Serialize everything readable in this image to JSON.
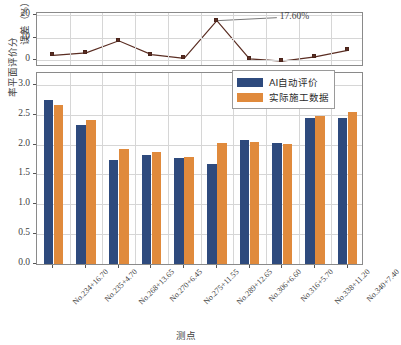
{
  "chart_data": [
    {
      "type": "line",
      "title": "",
      "ylabel": "误差（%）",
      "xlabel": "",
      "ylim": [
        -2,
        21
      ],
      "yticks": [
        0,
        10,
        20
      ],
      "grid": true,
      "categories": [
        "No.234+16.70",
        "No.235+4.70",
        "No.268+13.65",
        "No.270+6.45",
        "No.275+11.55",
        "No.289+12.65",
        "No.306+6.60",
        "No.316+5.70",
        "No.338+11.20",
        "No.340+7.40"
      ],
      "series": [
        {
          "name": "误差",
          "color": "#5a2d22",
          "values": [
            2.3,
            3.4,
            8.7,
            2.6,
            0.9,
            17.6,
            0.7,
            -0.3,
            1.6,
            4.5
          ]
        }
      ],
      "annotations": [
        {
          "text": "17.60%",
          "point_index": 5,
          "value": 17.6
        }
      ]
    },
    {
      "type": "bar",
      "title": "",
      "ylabel": "率平面评价分",
      "xlabel": "测点",
      "ylim": [
        0,
        3.2
      ],
      "yticks": [
        "0.0",
        "0.5",
        "1.0",
        "1.5",
        "2.0",
        "2.5",
        "3.0"
      ],
      "ytick_values": [
        0.0,
        0.5,
        1.0,
        1.5,
        2.0,
        2.5,
        3.0
      ],
      "grid": true,
      "legend_position": "upper right",
      "categories": [
        "No.234+16.70",
        "No.235+4.70",
        "No.268+13.65",
        "No.270+6.45",
        "No.275+11.55",
        "No.289+12.65",
        "No.306+6.60",
        "No.316+5.70",
        "No.338+11.20",
        "No.340+7.40"
      ],
      "series": [
        {
          "name": "AI自动评价",
          "color": "#2e4a7d",
          "values": [
            2.74,
            2.33,
            1.75,
            1.83,
            1.78,
            1.68,
            2.07,
            2.03,
            2.44,
            2.44
          ]
        },
        {
          "name": "实际施工数据",
          "color": "#e08a3c",
          "values": [
            2.67,
            2.42,
            1.92,
            1.88,
            1.8,
            2.03,
            2.04,
            2.01,
            2.48,
            2.55
          ]
        }
      ]
    }
  ],
  "top_chart": {
    "ylabel": "误差（%）",
    "yticks": [
      "0",
      "10",
      "20"
    ],
    "annotation": "17.60%"
  },
  "bottom_chart": {
    "ylabel": "率平面评价分",
    "xlabel": "测点",
    "yticks": [
      "0.0",
      "0.5",
      "1.0",
      "1.5",
      "2.0",
      "2.5",
      "3.0"
    ]
  },
  "legend": {
    "items": [
      {
        "label": "AI自动评价",
        "color": "#2e4a7d"
      },
      {
        "label": "实际施工数据",
        "color": "#e08a3c"
      }
    ]
  },
  "xticks": [
    "No.234+16.70",
    "No.235+4.70",
    "No.268+13.65",
    "No.270+6.45",
    "No.275+11.55",
    "No.289+12.65",
    "No.306+6.60",
    "No.316+5.70",
    "No.338+11.20",
    "No.340+7.40"
  ]
}
